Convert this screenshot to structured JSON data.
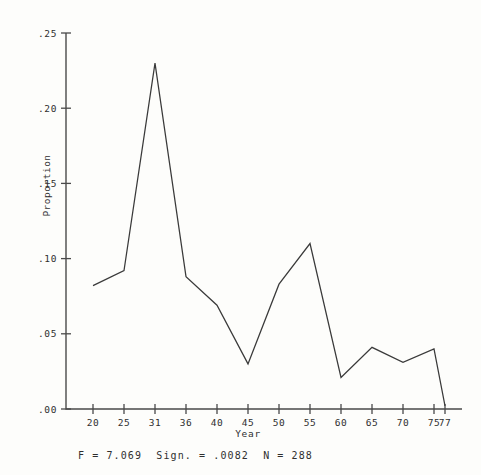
{
  "chart_data": {
    "type": "line",
    "title": "",
    "xlabel": "Year",
    "ylabel": "Proportion",
    "x": [
      20,
      25,
      31,
      36,
      40,
      45,
      50,
      55,
      60,
      65,
      70,
      75,
      77
    ],
    "values": [
      0.082,
      0.092,
      0.23,
      0.088,
      0.069,
      0.03,
      0.083,
      0.11,
      0.021,
      0.041,
      0.031,
      0.04,
      0.002
    ],
    "xticks": [
      20,
      25,
      31,
      36,
      40,
      45,
      50,
      55,
      60,
      65,
      70,
      75,
      77
    ],
    "xtick_labels": [
      "20",
      "25",
      "31",
      "36",
      "40",
      "45",
      "50",
      "55",
      "60",
      "65",
      "70",
      "75",
      "77"
    ],
    "yticks": [
      0.0,
      0.05,
      0.1,
      0.15,
      0.2,
      0.25
    ],
    "ytick_labels": [
      ".00",
      ".05",
      ".10",
      ".15",
      ".20",
      ".25"
    ],
    "xlim": [
      18,
      78
    ],
    "ylim": [
      0.0,
      0.25
    ],
    "grid": false,
    "legend": false,
    "line_color": "#3a3a3a",
    "axis_color": "#4a4a4a",
    "background": "#fdfdfb"
  },
  "annotations": {
    "footer": "F = 7.069  Sign. = .0082  N = 288",
    "f_value": "F = 7.069",
    "significance": "Sign. = .0082",
    "sample_size": "N = 288"
  }
}
